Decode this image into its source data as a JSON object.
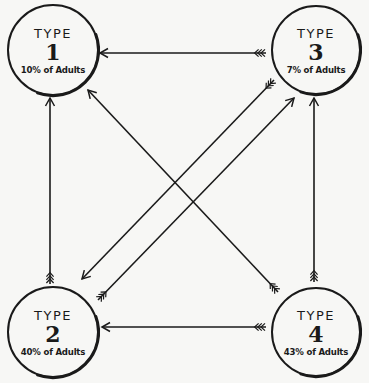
{
  "diagram": {
    "background": "#f7f7f5",
    "ink_color": "#1a1a1a",
    "nodes": [
      {
        "id": "1",
        "type_label": "TYPE",
        "number": "1",
        "share_label": "10% of Adults",
        "share_percent": 10,
        "cx": 53,
        "cy": 50,
        "r": 45
      },
      {
        "id": "2",
        "type_label": "TYPE",
        "number": "2",
        "share_label": "40% of Adults",
        "share_percent": 40,
        "cx": 53,
        "cy": 332,
        "r": 45
      },
      {
        "id": "3",
        "type_label": "TYPE",
        "number": "3",
        "share_label": "7% of Adults",
        "share_percent": 7,
        "cx": 316,
        "cy": 50,
        "r": 44
      },
      {
        "id": "4",
        "type_label": "TYPE",
        "number": "4",
        "share_label": "43% of Adults",
        "share_percent": 43,
        "cx": 316,
        "cy": 332,
        "r": 44
      }
    ],
    "edges": [
      {
        "from": "3",
        "to": "1",
        "x1": 266,
        "y1": 53,
        "x2": 100,
        "y2": 53
      },
      {
        "from": "4",
        "to": "2",
        "x1": 266,
        "y1": 327,
        "x2": 102,
        "y2": 327
      },
      {
        "from": "2",
        "to": "1",
        "x1": 50,
        "y1": 284,
        "x2": 50,
        "y2": 98
      },
      {
        "from": "4",
        "to": "3",
        "x1": 314,
        "y1": 282,
        "x2": 314,
        "y2": 98
      },
      {
        "from": "4",
        "to": "1",
        "x1": 278,
        "y1": 292,
        "x2": 88,
        "y2": 90
      },
      {
        "from": "3",
        "to": "2",
        "x1": 274,
        "y1": 80,
        "x2": 82,
        "y2": 279
      },
      {
        "from": "2",
        "to": "3",
        "x1": 98,
        "y1": 300,
        "x2": 294,
        "y2": 98
      }
    ]
  }
}
